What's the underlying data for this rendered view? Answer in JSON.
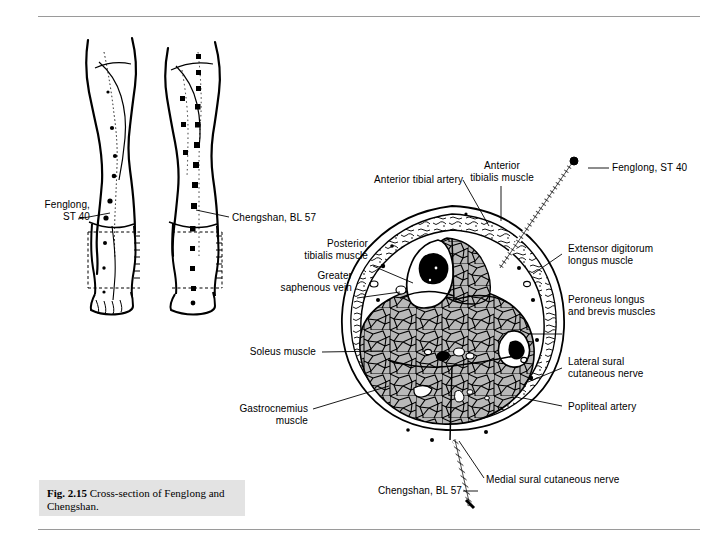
{
  "figure": {
    "caption_number": "Fig. 2.15",
    "caption_text": "Cross-section of Fenglong and Chengshan."
  },
  "leg_diagrams": {
    "left_view_label_line1": "Fenglong,",
    "left_view_label_line2": "ST 40",
    "right_view_label": "Chengshan, BL 57"
  },
  "cross_section": {
    "labels": {
      "anterior_tibial_artery": "Anterior tibial artery",
      "anterior_tibialis_muscle_line1": "Anterior",
      "anterior_tibialis_muscle_line2": "tibialis muscle",
      "posterior_tibialis_muscle_line1": "Posterior",
      "posterior_tibialis_muscle_line2": "tibialis muscle",
      "greater_saphenous_vein_line1": "Greater",
      "greater_saphenous_vein_line2": "saphenous vein",
      "soleus_muscle": "Soleus muscle",
      "gastrocnemius_muscle_line1": "Gastrocnemius",
      "gastrocnemius_muscle_line2": "muscle",
      "extensor_digitorum_line1": "Extensor digitorum",
      "extensor_digitorum_line2": "longus muscle",
      "peroneus_line1": "Peroneus longus",
      "peroneus_line2": "and brevis muscles",
      "lateral_sural_line1": "Lateral sural",
      "lateral_sural_line2": "cutaneous nerve",
      "popliteal_artery": "Popliteal artery",
      "medial_sural_cutaneous_nerve": "Medial sural cutaneous nerve"
    },
    "acupoints": {
      "fenglong": "Fenglong, ST 40",
      "chengshan": "Chengshan, BL 57"
    }
  },
  "colors": {
    "rule": "#9a9a9a",
    "caption_background": "#e3e3e3",
    "muscle_fill": "#b8b8b8",
    "fascia_fill": "#ffffff",
    "ink": "#000000"
  }
}
